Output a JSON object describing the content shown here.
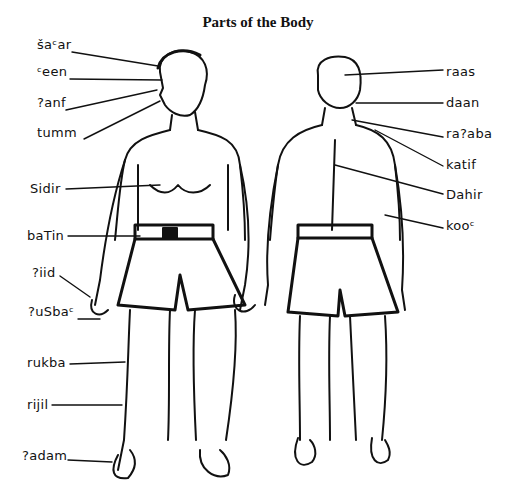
{
  "title": "Parts of the Body",
  "front_labels": [
    {
      "label": "šaᶜar",
      "x": 37,
      "y": 38
    },
    {
      "label": "ᶜeen",
      "x": 37,
      "y": 65
    },
    {
      "label": "?anf",
      "x": 37,
      "y": 96
    },
    {
      "label": "tumm",
      "x": 37,
      "y": 126
    },
    {
      "label": "Sidir",
      "x": 30,
      "y": 182
    },
    {
      "label": "baTin",
      "x": 27,
      "y": 229
    },
    {
      "label": "?iid",
      "x": 32,
      "y": 266
    },
    {
      "label": "?uSbaᶜ",
      "x": 28,
      "y": 305
    },
    {
      "label": "rukba",
      "x": 27,
      "y": 356
    },
    {
      "label": "rijil",
      "x": 27,
      "y": 398
    },
    {
      "label": "?adam",
      "x": 22,
      "y": 449
    }
  ],
  "back_labels": [
    {
      "label": "raas",
      "x": 446,
      "y": 65
    },
    {
      "label": "daan",
      "x": 446,
      "y": 96
    },
    {
      "label": "ra?aba",
      "x": 446,
      "y": 127
    },
    {
      "label": "katif",
      "x": 446,
      "y": 158
    },
    {
      "label": "Dahir",
      "x": 446,
      "y": 188
    },
    {
      "label": "kooᶜ",
      "x": 446,
      "y": 219
    }
  ]
}
